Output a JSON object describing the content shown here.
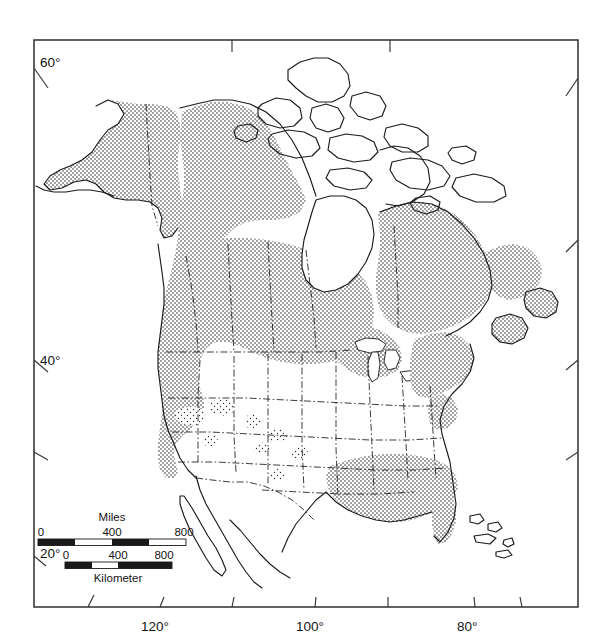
{
  "figure": {
    "kind": "distribution-map",
    "region": "North America",
    "projection": "conic",
    "background_color": "#ffffff",
    "line_color": "#1a1a1a",
    "fill_pattern": "stipple-dots",
    "neatline": {
      "left": 34,
      "top": 40,
      "right": 578,
      "bottom": 607
    }
  },
  "graticule": {
    "latitude_labels": [
      {
        "text": "60°",
        "x": 39,
        "y": 62
      },
      {
        "text": "40°",
        "x": 39,
        "y": 360
      },
      {
        "text": "20°",
        "x": 39,
        "y": 553
      }
    ],
    "longitude_labels": [
      {
        "text": "120°",
        "x": 149,
        "y": 629
      },
      {
        "text": "100°",
        "x": 310,
        "y": 629
      },
      {
        "text": "80°",
        "x": 468,
        "y": 629
      }
    ],
    "unlabeled_lat_tick_y": 452,
    "unlabeled_lon_tick_x": [
      88,
      232,
      388,
      522
    ]
  },
  "scale_bars": [
    {
      "name": "miles",
      "title": "Miles",
      "title_position": "above",
      "ticks": [
        "0",
        "400",
        "800"
      ],
      "bar_left": 38,
      "bar_right": 186,
      "bar_y": 541,
      "title_x": 112,
      "title_y": 521,
      "label_y": 536,
      "segments": 4
    },
    {
      "name": "kilometer",
      "title": "Kilometer",
      "title_position": "below",
      "ticks": [
        "0",
        "400",
        "800"
      ],
      "bar_left": 65,
      "bar_right": 172,
      "bar_y": 564,
      "title_x": 118,
      "title_y": 581,
      "label_y": 559,
      "segments": 4
    }
  ],
  "legend_note": {
    "shaded_meaning": "species range / distribution (stippled)",
    "unshaded_meaning": "outside range / water"
  }
}
